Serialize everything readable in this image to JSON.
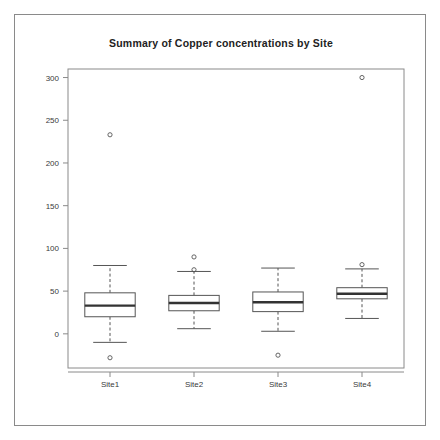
{
  "chart_data": {
    "type": "box",
    "title": "Summary of Copper concentrations by Site",
    "xlabel": "",
    "ylabel": "",
    "categories": [
      "Site1",
      "Site2",
      "Site3",
      "Site4"
    ],
    "ylim": [
      -40,
      310
    ],
    "yticks": [
      0,
      50,
      100,
      150,
      200,
      250,
      300
    ],
    "ytick_labels": [
      "0",
      "50",
      "100",
      "150",
      "200",
      "250",
      "300"
    ],
    "grid": false,
    "legend": null,
    "boxes": [
      {
        "category": "Site1",
        "whisker_low": -10,
        "q1": 20,
        "median": 33,
        "q3": 48,
        "whisker_high": 80,
        "outliers": [
          233,
          -28
        ]
      },
      {
        "category": "Site2",
        "whisker_low": 6,
        "q1": 27,
        "median": 36,
        "q3": 45,
        "whisker_high": 73,
        "outliers": [
          90,
          75
        ]
      },
      {
        "category": "Site3",
        "whisker_low": 3,
        "q1": 26,
        "median": 37,
        "q3": 49,
        "whisker_high": 77,
        "outliers": [
          -25
        ]
      },
      {
        "category": "Site4",
        "whisker_low": 18,
        "q1": 41,
        "median": 47,
        "q3": 54,
        "whisker_high": 76,
        "outliers": [
          300,
          81
        ]
      }
    ]
  },
  "colors": {
    "background": "#ffffff",
    "border": "#8a8a8a",
    "axis": "#8a8a8a",
    "box_stroke": "#555555",
    "median": "#333333",
    "title": "#222222",
    "tick_text": "#3a3a3a"
  }
}
